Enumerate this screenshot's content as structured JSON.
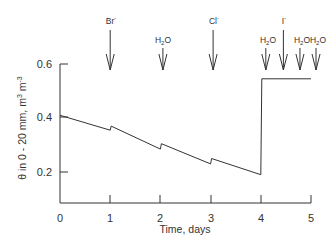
{
  "chart_data": {
    "type": "line",
    "title": "",
    "xlabel": "Time, days",
    "ylabel": "θ in 0 - 20 mm, m³ m⁻³",
    "xlim": [
      0,
      5
    ],
    "ylim": [
      0.085,
      0.6
    ],
    "x_ticks": [
      0,
      1,
      2,
      3,
      4,
      5
    ],
    "x_tick_labels": [
      "0",
      "1",
      "2",
      "3",
      "4",
      "5"
    ],
    "y_ticks": [
      0.2,
      0.4,
      0.6
    ],
    "y_tick_labels": [
      "0.2",
      "0.4",
      "0.6"
    ],
    "grid": false,
    "legend": null,
    "series": [
      {
        "name": "water content",
        "color": "#333333",
        "x": [
          0,
          1.0,
          1.02,
          2.0,
          2.02,
          3.0,
          3.02,
          4.0,
          4.02,
          5.0
        ],
        "y": [
          0.41,
          0.355,
          0.37,
          0.285,
          0.305,
          0.23,
          0.25,
          0.19,
          0.545,
          0.545
        ]
      }
    ],
    "annotations": [
      {
        "kind": "arrow",
        "size": "large",
        "x": 1.0,
        "label": "Br",
        "superscript": "-"
      },
      {
        "kind": "arrow",
        "size": "small",
        "x": 2.05,
        "label": "H",
        "subscript": "2",
        "label_tail": "O"
      },
      {
        "kind": "arrow",
        "size": "large",
        "x": 3.05,
        "label": "Cl",
        "superscript": "-"
      },
      {
        "kind": "arrow",
        "size": "small",
        "x": 4.1,
        "label": "H",
        "subscript": "2",
        "label_tail": "O"
      },
      {
        "kind": "arrow",
        "size": "large",
        "x": 4.45,
        "label": "I",
        "superscript": "-"
      },
      {
        "kind": "arrow",
        "size": "small",
        "x": 4.78,
        "label": "H",
        "subscript": "2",
        "label_tail": "O"
      },
      {
        "kind": "arrow",
        "size": "small",
        "x": 5.1,
        "label": "H",
        "subscript": "2",
        "label_tail": "O"
      }
    ]
  },
  "labels": {
    "x_axis_title": "Time, days",
    "y_axis_title_main": "θ in 0 - 20 mm, m",
    "y_axis_sup1": "3",
    "y_axis_mid": " m",
    "y_axis_sup2": "-3",
    "x_ticks": [
      "0",
      "1",
      "2",
      "3",
      "4",
      "5"
    ],
    "y_ticks": [
      "0.2",
      "0.4",
      "0.6"
    ],
    "ann_br": "Br",
    "ann_cl": "Cl",
    "ann_i": "I",
    "ann_minus": "-",
    "ann_h": "H",
    "ann_2": "2",
    "ann_o": "O"
  },
  "colors": {
    "ink": "#333333",
    "background": "#ffffff"
  }
}
